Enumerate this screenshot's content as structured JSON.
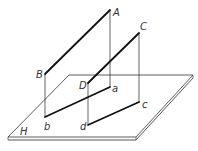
{
  "diagram": {
    "type": "descriptive-geometry projection of two parallel lines onto plane H",
    "plane": {
      "label": "H",
      "corners": [
        [
          69,
          75
        ],
        [
          193,
          75
        ],
        [
          136,
          137
        ],
        [
          8,
          137
        ]
      ]
    },
    "lines": [
      {
        "name": "AB",
        "space": {
          "A": [
            110,
            10
          ],
          "B": [
            45,
            74
          ]
        },
        "projection": {
          "a": [
            110,
            87
          ],
          "b": [
            45,
            117
          ]
        }
      },
      {
        "name": "CD",
        "space": {
          "C": [
            139,
            33
          ],
          "D": [
            88,
            83
          ]
        },
        "projection": {
          "c": [
            139,
            102
          ],
          "d": [
            88,
            125
          ]
        }
      }
    ],
    "labels": {
      "A": "A",
      "B": "B",
      "C": "C",
      "D": "D",
      "a": "a",
      "b": "b",
      "c": "c",
      "d": "d",
      "H": "H"
    },
    "colors": {
      "line": "#111111",
      "thin": "#222222",
      "plane_edge": "#555555"
    }
  }
}
